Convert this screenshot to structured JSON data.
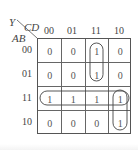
{
  "kmap": {
    "output_label": "Y",
    "col_var_label": "CD",
    "row_var_label": "AB",
    "col_headers": [
      "00",
      "01",
      "11",
      "10"
    ],
    "row_headers": [
      "00",
      "01",
      "11",
      "10"
    ],
    "cells": [
      [
        "0",
        "0",
        "1",
        "0"
      ],
      [
        "0",
        "0",
        "1",
        "0"
      ],
      [
        "1",
        "1",
        "1",
        "1"
      ],
      [
        "0",
        "0",
        "0",
        "1"
      ]
    ],
    "groupings": [
      {
        "name": "vertical-pair-col-11",
        "cells": [
          [
            0,
            2
          ],
          [
            1,
            2
          ]
        ]
      },
      {
        "name": "row-11-quad",
        "cells": [
          [
            2,
            0
          ],
          [
            2,
            1
          ],
          [
            2,
            2
          ],
          [
            2,
            3
          ]
        ]
      },
      {
        "name": "vertical-pair-col-10",
        "cells": [
          [
            2,
            3
          ],
          [
            3,
            3
          ]
        ]
      }
    ],
    "line_color": "#555555",
    "text_color": "#555555"
  }
}
